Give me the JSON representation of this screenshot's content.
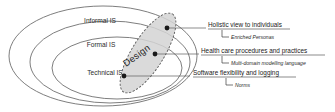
{
  "figure": {
    "background_color": "#ffffff",
    "stroke_color": "#6f6f6f",
    "design_fill_color": "#d4d4d4",
    "dot_color": "#1a1a1a"
  },
  "rings": [
    {
      "id": "informal-is",
      "label": "Informal IS"
    },
    {
      "id": "formal-is",
      "label": "Formal IS"
    },
    {
      "id": "technical-is",
      "label": "Technical IS"
    }
  ],
  "design": {
    "label": "Design",
    "rotation_degrees": -58
  },
  "callouts": [
    {
      "id": "holistic-view",
      "title": "Holistic view to individuals",
      "sub": "Enriched Personas"
    },
    {
      "id": "health-care-procedures",
      "title": "Health care procedures and practices",
      "sub": "Multi-domain modelling language"
    },
    {
      "id": "software-flexibility",
      "title": "Software flexibility and logging",
      "sub": "Norms"
    }
  ]
}
